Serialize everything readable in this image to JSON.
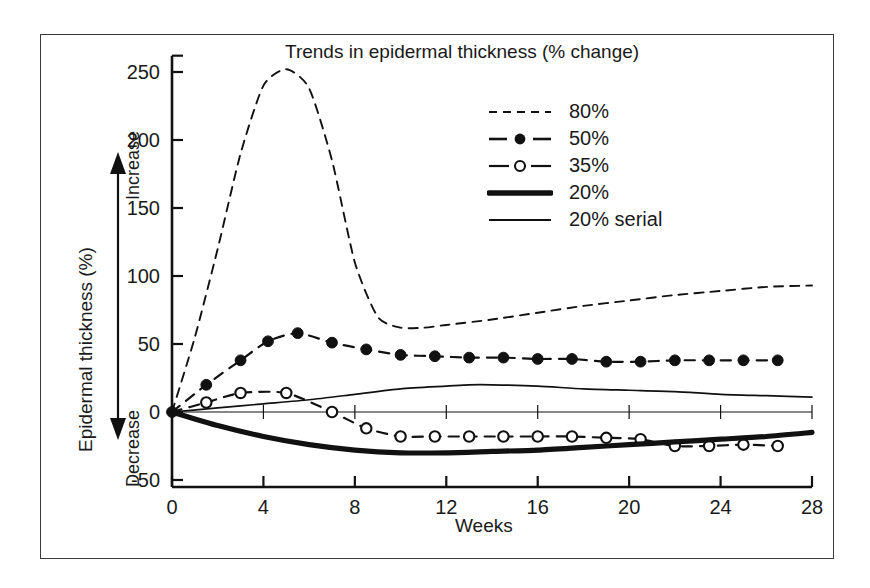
{
  "chart_data": {
    "type": "line",
    "title": "Trends in epidermal thickness (% change)",
    "xlabel": "Weeks",
    "ylabel": "Epidermal thickness (%)",
    "ylabel_top_direction": "Increase",
    "ylabel_bottom_direction": "Decrease",
    "xlim": [
      0,
      28
    ],
    "ylim": [
      -70,
      260
    ],
    "xticks": [
      0,
      4,
      8,
      12,
      16,
      20,
      24,
      28
    ],
    "xticklabels": [
      "0",
      "4",
      "8",
      "12",
      "16",
      "20",
      "24",
      "28"
    ],
    "yticks": [
      -50,
      0,
      50,
      100,
      150,
      200,
      250
    ],
    "yticklabels": [
      "-50",
      "0",
      "50",
      "100",
      "150",
      "200",
      "250"
    ],
    "grid": false,
    "legend_position": "upper right",
    "zero_line": true,
    "series": [
      {
        "name": "80%",
        "style": "dashed",
        "marker": "none",
        "color": "#111111",
        "x": [
          0,
          1,
          2,
          3,
          4,
          5,
          6,
          7,
          8,
          9,
          10,
          11,
          12,
          14,
          16,
          18,
          20,
          22,
          24,
          26,
          28
        ],
        "values": [
          0,
          55,
          120,
          190,
          240,
          252,
          238,
          185,
          110,
          70,
          62,
          62,
          64,
          68,
          73,
          78,
          82,
          86,
          89,
          92,
          93
        ]
      },
      {
        "name": "50%",
        "style": "dashed",
        "marker": "filled-circle",
        "color": "#111111",
        "x": [
          0,
          1.5,
          3,
          4.2,
          5.5,
          7,
          8.5,
          10,
          11.5,
          13,
          14.5,
          16,
          17.5,
          19,
          20.5,
          22,
          23.5,
          25,
          26.5
        ],
        "values": [
          0,
          20,
          38,
          52,
          58,
          51,
          46,
          42,
          41,
          40,
          40,
          39,
          39,
          37,
          37,
          38,
          38,
          38,
          38
        ]
      },
      {
        "name": "35%",
        "style": "dashed",
        "marker": "open-circle",
        "color": "#111111",
        "x": [
          0,
          1.5,
          3,
          5,
          7,
          8.5,
          10,
          11.5,
          13,
          14.5,
          16,
          17.5,
          19,
          20.5,
          22,
          23.5,
          25,
          26.5
        ],
        "values": [
          0,
          7,
          14,
          14,
          0,
          -12,
          -18,
          -18,
          -18,
          -18,
          -18,
          -18,
          -19,
          -20,
          -25,
          -25,
          -24,
          -25
        ]
      },
      {
        "name": "20%",
        "style": "solid-thick",
        "marker": "none",
        "color": "#111111",
        "x": [
          0,
          2,
          4,
          6,
          8,
          10,
          12,
          14,
          16,
          18,
          20,
          22,
          24,
          26,
          28
        ],
        "values": [
          0,
          -10,
          -18,
          -24,
          -28,
          -30,
          -30,
          -29,
          -28,
          -26,
          -24,
          -22,
          -20,
          -18,
          -15
        ]
      },
      {
        "name": "20% serial",
        "style": "solid-thin",
        "marker": "none",
        "color": "#111111",
        "x": [
          0,
          2,
          4,
          6,
          8,
          10,
          12,
          13,
          14,
          16,
          18,
          20,
          22,
          24,
          26,
          28
        ],
        "values": [
          0,
          3,
          6,
          9,
          13,
          17,
          19,
          20,
          20,
          19,
          17,
          16,
          15,
          13,
          12,
          11
        ]
      }
    ]
  },
  "legend": {
    "items": [
      {
        "label": "80%",
        "key": "dashed"
      },
      {
        "label": "50%",
        "key": "dashed-filled-circle"
      },
      {
        "label": "35%",
        "key": "dashed-open-circle"
      },
      {
        "label": "20%",
        "key": "solid-thick"
      },
      {
        "label": "20% serial",
        "key": "solid-thin"
      }
    ]
  }
}
